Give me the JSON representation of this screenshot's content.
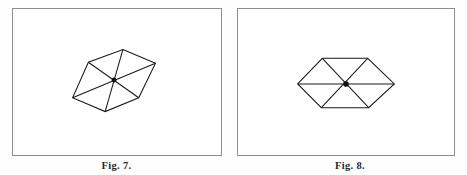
{
  "sheet": {
    "background_color": "#fefefe",
    "line_color": "#1a1a1a",
    "frame_color": "#8e8e8e",
    "caption_color": "#2b2b2b"
  },
  "figures": [
    {
      "id": "fig-7",
      "caption": "Fig. 7.",
      "description": "oblique rhombic hexagon with three crossing diagonals",
      "frame": {
        "x": 12,
        "y": 8,
        "width": 210,
        "height": 148
      },
      "geometry": {
        "vertices": [
          {
            "name": "top",
            "x": 111,
            "y": 41
          },
          {
            "name": "upper-right",
            "x": 144,
            "y": 55
          },
          {
            "name": "lower-right",
            "x": 127,
            "y": 90
          },
          {
            "name": "bottom",
            "x": 93,
            "y": 104
          },
          {
            "name": "lower-left",
            "x": 60,
            "y": 90
          },
          {
            "name": "upper-left",
            "x": 76,
            "y": 54
          }
        ],
        "diagonals": [
          {
            "from": "top",
            "to": "bottom"
          },
          {
            "from": "upper-right",
            "to": "lower-left"
          },
          {
            "from": "upper-left",
            "to": "lower-right"
          }
        ],
        "center": {
          "x": 102,
          "y": 72,
          "radius": 2.2
        }
      }
    },
    {
      "id": "fig-8",
      "caption": "Fig. 8.",
      "description": "symmetric horizontal hexagon with three crossing diagonals",
      "frame": {
        "x": 4,
        "y": 8,
        "width": 218,
        "height": 148
      },
      "geometry": {
        "vertices": [
          {
            "name": "left",
            "x": 60,
            "y": 76
          },
          {
            "name": "upper-left",
            "x": 85,
            "y": 50
          },
          {
            "name": "upper-right",
            "x": 131,
            "y": 50
          },
          {
            "name": "right",
            "x": 158,
            "y": 76
          },
          {
            "name": "lower-right",
            "x": 132,
            "y": 100
          },
          {
            "name": "lower-left",
            "x": 84,
            "y": 100
          }
        ],
        "diagonals": [
          {
            "from": "left",
            "to": "right"
          },
          {
            "from": "upper-left",
            "to": "lower-right"
          },
          {
            "from": "upper-right",
            "to": "lower-left"
          }
        ],
        "center": {
          "x": 109,
          "y": 76,
          "radius": 2.6
        }
      }
    }
  ]
}
